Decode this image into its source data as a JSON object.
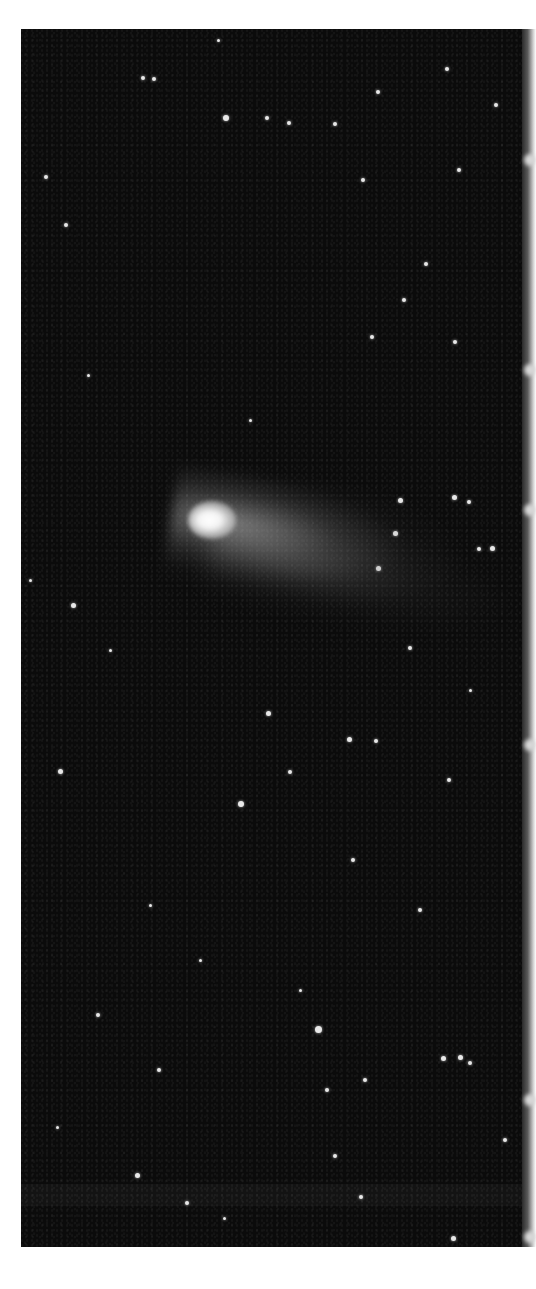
{
  "image": {
    "subject": "Comet with diffuse tail against a dense star field",
    "style": "black-and-white astrophotograph",
    "colors": {
      "page_background": "#ffffff",
      "sky": "#0b0b0b",
      "comet_head": "#ffffff",
      "tail": "#a0a0a0",
      "stars": "#e8e8e8"
    }
  },
  "stars": [
    {
      "x": 226,
      "y": 118,
      "r": 3
    },
    {
      "x": 267,
      "y": 118,
      "r": 2
    },
    {
      "x": 289,
      "y": 123,
      "r": 2
    },
    {
      "x": 335,
      "y": 124,
      "r": 2
    },
    {
      "x": 143,
      "y": 78,
      "r": 2
    },
    {
      "x": 154,
      "y": 79,
      "r": 2
    },
    {
      "x": 378,
      "y": 92,
      "r": 2
    },
    {
      "x": 447,
      "y": 69,
      "r": 2
    },
    {
      "x": 46,
      "y": 177,
      "r": 2
    },
    {
      "x": 363,
      "y": 180,
      "r": 2
    },
    {
      "x": 459,
      "y": 170,
      "r": 2
    },
    {
      "x": 218,
      "y": 40,
      "r": 1.5
    },
    {
      "x": 496,
      "y": 105,
      "r": 2
    },
    {
      "x": 66,
      "y": 225,
      "r": 2
    },
    {
      "x": 404,
      "y": 300,
      "r": 2
    },
    {
      "x": 426,
      "y": 264,
      "r": 2
    },
    {
      "x": 372,
      "y": 337,
      "r": 2
    },
    {
      "x": 455,
      "y": 342,
      "r": 2
    },
    {
      "x": 88,
      "y": 375,
      "r": 1.5
    },
    {
      "x": 250,
      "y": 420,
      "r": 1.5
    },
    {
      "x": 400,
      "y": 500,
      "r": 2.5
    },
    {
      "x": 454,
      "y": 497,
      "r": 2.5
    },
    {
      "x": 469,
      "y": 502,
      "r": 2
    },
    {
      "x": 395,
      "y": 533,
      "r": 2.5
    },
    {
      "x": 479,
      "y": 549,
      "r": 2
    },
    {
      "x": 492,
      "y": 548,
      "r": 2.5
    },
    {
      "x": 378,
      "y": 568,
      "r": 2.5
    },
    {
      "x": 73,
      "y": 605,
      "r": 2.5
    },
    {
      "x": 410,
      "y": 648,
      "r": 2
    },
    {
      "x": 268,
      "y": 713,
      "r": 2.5
    },
    {
      "x": 349,
      "y": 739,
      "r": 2.5
    },
    {
      "x": 376,
      "y": 741,
      "r": 2
    },
    {
      "x": 60,
      "y": 771,
      "r": 2.5
    },
    {
      "x": 290,
      "y": 772,
      "r": 2
    },
    {
      "x": 449,
      "y": 780,
      "r": 2
    },
    {
      "x": 241,
      "y": 804,
      "r": 3
    },
    {
      "x": 353,
      "y": 860,
      "r": 2
    },
    {
      "x": 150,
      "y": 905,
      "r": 1.5
    },
    {
      "x": 420,
      "y": 910,
      "r": 2
    },
    {
      "x": 98,
      "y": 1015,
      "r": 2
    },
    {
      "x": 318,
      "y": 1029,
      "r": 3.5
    },
    {
      "x": 443,
      "y": 1058,
      "r": 2.5
    },
    {
      "x": 460,
      "y": 1057,
      "r": 2.5
    },
    {
      "x": 470,
      "y": 1063,
      "r": 2
    },
    {
      "x": 159,
      "y": 1070,
      "r": 2
    },
    {
      "x": 365,
      "y": 1080,
      "r": 2
    },
    {
      "x": 327,
      "y": 1090,
      "r": 2
    },
    {
      "x": 57,
      "y": 1127,
      "r": 1.5
    },
    {
      "x": 137,
      "y": 1175,
      "r": 2.5
    },
    {
      "x": 335,
      "y": 1156,
      "r": 2
    },
    {
      "x": 361,
      "y": 1197,
      "r": 2
    },
    {
      "x": 453,
      "y": 1238,
      "r": 2.5
    },
    {
      "x": 505,
      "y": 1140,
      "r": 2
    },
    {
      "x": 187,
      "y": 1203,
      "r": 2
    },
    {
      "x": 224,
      "y": 1218,
      "r": 1.5
    },
    {
      "x": 30,
      "y": 580,
      "r": 1.5
    },
    {
      "x": 110,
      "y": 650,
      "r": 1.5
    },
    {
      "x": 470,
      "y": 690,
      "r": 1.5
    },
    {
      "x": 200,
      "y": 960,
      "r": 1.5
    },
    {
      "x": 300,
      "y": 990,
      "r": 1.5
    }
  ],
  "edge_blobs": [
    160,
    370,
    510,
    745,
    1100,
    1237
  ]
}
